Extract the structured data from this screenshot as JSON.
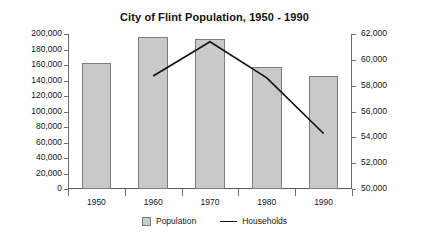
{
  "chart_data": {
    "type": "bar",
    "title": "City of Flint Population, 1950 - 1990",
    "xlabel": "",
    "ylabel": "",
    "categories": [
      "1950",
      "1960",
      "1970",
      "1980",
      "1990"
    ],
    "grid": false,
    "legend_position": "bottom",
    "series": [
      {
        "name": "Population",
        "type": "bar",
        "axis": "left",
        "values": [
          163000,
          196000,
          193000,
          157000,
          146000
        ],
        "color": "#c9c9c9",
        "border_color": "#7b7b7b"
      },
      {
        "name": "Households",
        "type": "line",
        "axis": "right",
        "values": [
          null,
          58750,
          61400,
          58600,
          54300
        ],
        "color": "#111111"
      }
    ],
    "left_axis": {
      "min": 0,
      "max": 200000,
      "step": 20000,
      "ticks": [
        "0",
        "20,000",
        "40,000",
        "60,000",
        "80,000",
        "100,000",
        "120,000",
        "140,000",
        "160,000",
        "180,000",
        "200,000"
      ]
    },
    "right_axis": {
      "min": 50000,
      "max": 62000,
      "step": 2000,
      "ticks": [
        "50,000",
        "52,000",
        "54,000",
        "56,000",
        "58,000",
        "60,000",
        "62,000"
      ]
    },
    "legend": [
      {
        "label": "Population",
        "marker": "bar-swatch"
      },
      {
        "label": "Households",
        "marker": "line-swatch"
      }
    ]
  }
}
